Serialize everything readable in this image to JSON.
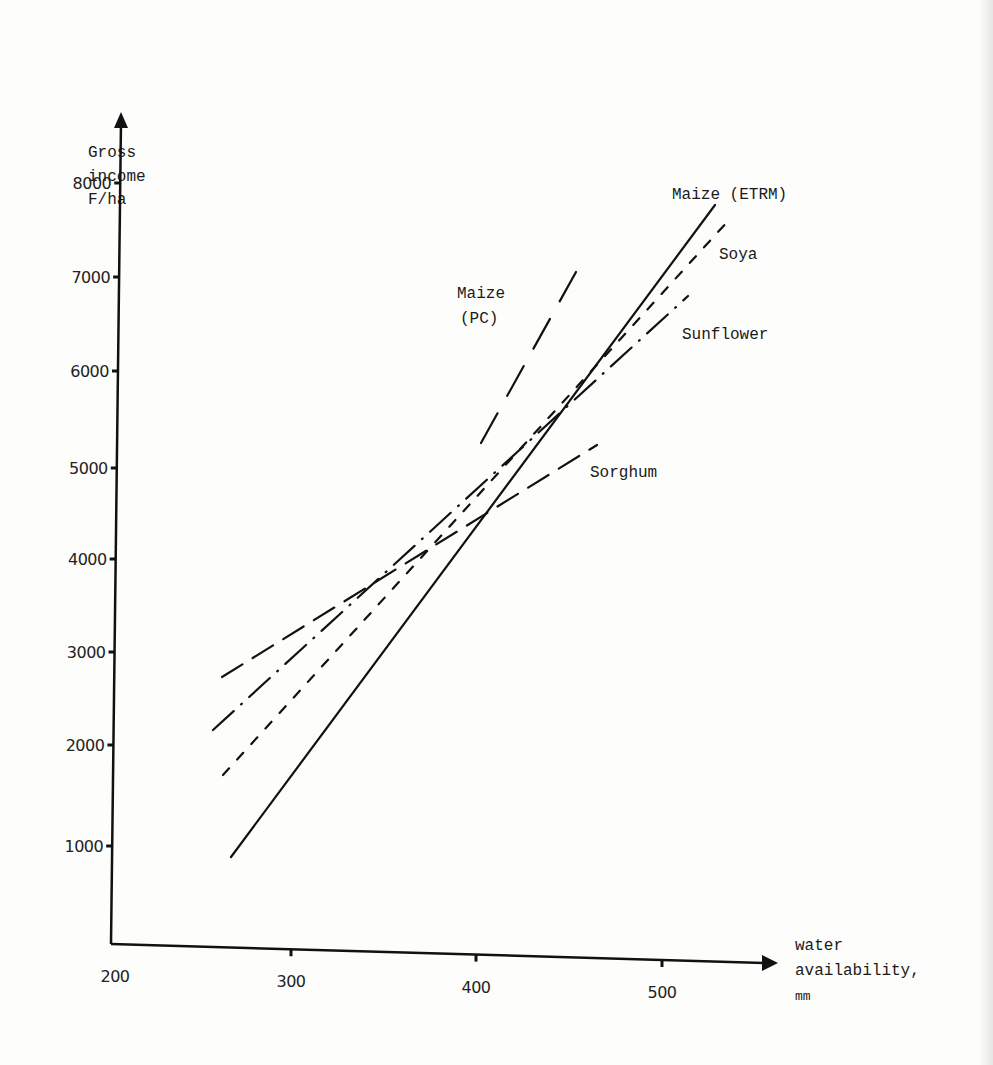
{
  "chart_data": {
    "type": "line",
    "title": "",
    "xlabel": "water availability, mm",
    "ylabel": "Gross income F/ha",
    "xlabel_lines": [
      "water",
      "availability,",
      "mm"
    ],
    "ylabel_lines": [
      "Gross",
      "income",
      "F/ha"
    ],
    "xlim": [
      200,
      560
    ],
    "ylim": [
      0,
      8500
    ],
    "x_ticks": [
      200,
      300,
      400,
      500
    ],
    "y_ticks": [
      1000,
      2000,
      3000,
      4000,
      5000,
      6000,
      7000,
      8000
    ],
    "grid": false,
    "legend": "inline labels at line ends",
    "series": [
      {
        "name": "Maize (ETRM)",
        "label_lines": [
          "Maize (ETRM)"
        ],
        "style": "solid",
        "x": [
          265,
          530
        ],
        "y": [
          900,
          7850
        ]
      },
      {
        "name": "Soya",
        "label_lines": [
          "Soya"
        ],
        "style": "short-dash",
        "x": [
          260,
          535
        ],
        "y": [
          1750,
          7650
        ]
      },
      {
        "name": "Sunflower",
        "label_lines": [
          "Sunflower"
        ],
        "style": "dash-dot",
        "x": [
          255,
          515
        ],
        "y": [
          2250,
          6850
        ]
      },
      {
        "name": "Sorghum",
        "label_lines": [
          "Sorghum"
        ],
        "style": "long-dash",
        "x": [
          260,
          465
        ],
        "y": [
          2800,
          5250
        ]
      },
      {
        "name": "Maize (PC)",
        "label_lines": [
          "Maize",
          "(PC)"
        ],
        "style": "long-dash-gap",
        "x": [
          405,
          457
        ],
        "y": [
          5300,
          7100
        ]
      }
    ]
  },
  "labels": {
    "y_axis": [
      "Gross",
      "income",
      "F/ha"
    ],
    "x_axis": [
      "water",
      "availability,",
      "mm"
    ],
    "maize_etrm": "Maize (ETRM)",
    "soya": "Soya",
    "sunflower": "Sunflower",
    "sorghum": "Sorghum",
    "maize_pc": [
      "Maize",
      "(PC)"
    ]
  }
}
